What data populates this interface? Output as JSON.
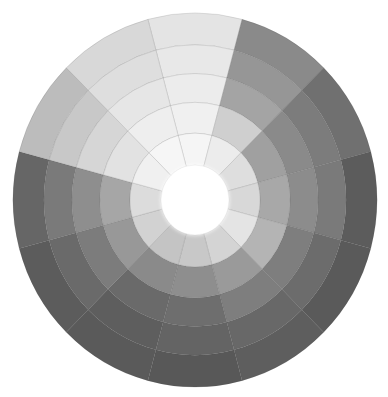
{
  "image": {
    "subject": "grayscale value color wheel",
    "center": [
      195,
      200
    ],
    "radius_x": 182,
    "radius_y": 187,
    "core_radius": 34,
    "ring_outer_radii": [
      182,
      151,
      123,
      95,
      65
    ],
    "sector_count": 12,
    "sector_start_deg": -15,
    "background": "#ffffff"
  },
  "sectors": [
    {
      "rings": [
        "#e4e4e4",
        "#e8e8e8",
        "#ececec",
        "#f0f0f0",
        "#f5f5f5"
      ]
    },
    {
      "rings": [
        "#8a8a8a",
        "#969696",
        "#a4a4a4",
        "#cfcfcf",
        "#ececec"
      ]
    },
    {
      "rings": [
        "#707070",
        "#7c7c7c",
        "#8a8a8a",
        "#a0a0a0",
        "#dedede"
      ]
    },
    {
      "rings": [
        "#5c5c5c",
        "#7a7a7a",
        "#8c8c8c",
        "#a8a8a8",
        "#d8d8d8"
      ]
    },
    {
      "rings": [
        "#5a5a5a",
        "#6c6c6c",
        "#7e7e7e",
        "#b4b4b4",
        "#e4e4e4"
      ]
    },
    {
      "rings": [
        "#5e5e5e",
        "#686868",
        "#7e7e7e",
        "#9a9a9a",
        "#d4d4d4"
      ]
    },
    {
      "rings": [
        "#585858",
        "#646464",
        "#6e6e6e",
        "#8e8e8e",
        "#c8c8c8"
      ]
    },
    {
      "rings": [
        "#5a5a5a",
        "#5e5e5e",
        "#6a6a6a",
        "#8a8a8a",
        "#c4c4c4"
      ]
    },
    {
      "rings": [
        "#5c5c5c",
        "#6a6a6a",
        "#7c7c7c",
        "#989898",
        "#d2d2d2"
      ]
    },
    {
      "rings": [
        "#666666",
        "#7a7a7a",
        "#8e8e8e",
        "#a6a6a6",
        "#dcdcdc"
      ]
    },
    {
      "rings": [
        "#bcbcbc",
        "#c8c8c8",
        "#d6d6d6",
        "#e2e2e2",
        "#f0f0f0"
      ]
    },
    {
      "rings": [
        "#d8d8d8",
        "#dedede",
        "#e6e6e6",
        "#eeeeee",
        "#f6f6f6"
      ]
    }
  ],
  "core_color": "#ffffff"
}
